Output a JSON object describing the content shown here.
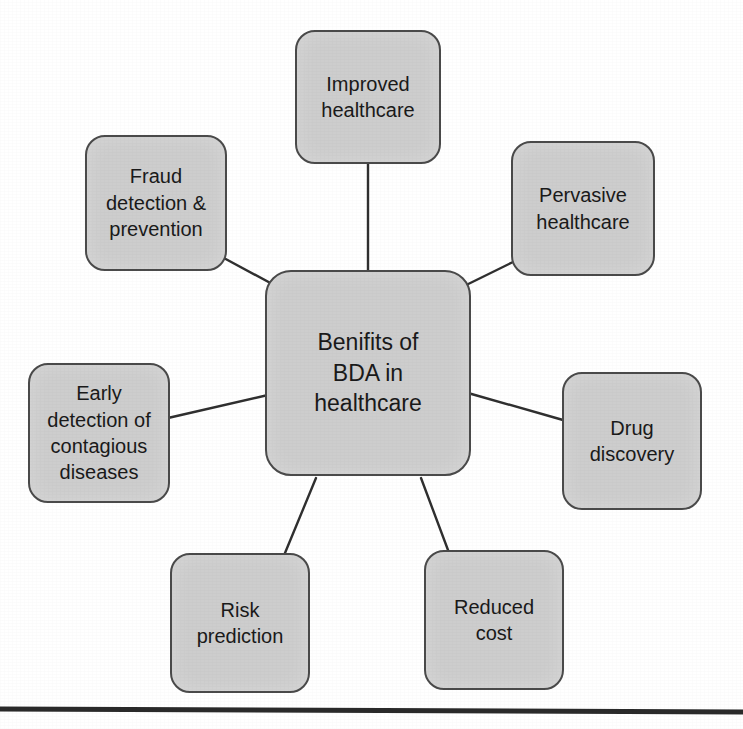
{
  "diagram": {
    "title": "Benifits of BDA in healthcare",
    "type": "hub-and-spoke mind map",
    "style": {
      "node_fill": "#cdcdcd",
      "node_border": "#4a4a4a",
      "connector_color": "#2f2f2f",
      "text_color": "#1a1a1a",
      "background": "#ffffff",
      "rule_color": "#2a2a2a"
    },
    "hub": {
      "label": "Benifits of\nBDA in\nhealthcare",
      "x": 265,
      "y": 270,
      "width": 206,
      "height": 206
    },
    "nodes": [
      {
        "id": "improved-healthcare",
        "label": "Improved\nhealthcare",
        "x": 295,
        "y": 30,
        "width": 146,
        "height": 134,
        "link": {
          "x1": 368,
          "y1": 164,
          "x2": 368,
          "y2": 270
        }
      },
      {
        "id": "fraud-detection-prevention",
        "label": "Fraud\ndetection &\nprevention",
        "x": 85,
        "y": 135,
        "width": 142,
        "height": 136,
        "link": {
          "x1": 222,
          "y1": 257,
          "x2": 287,
          "y2": 292
        }
      },
      {
        "id": "pervasive-healthcare",
        "label": "Pervasive\nhealthcare",
        "x": 511,
        "y": 141,
        "width": 144,
        "height": 135,
        "link": {
          "x1": 513,
          "y1": 262,
          "x2": 452,
          "y2": 292
        }
      },
      {
        "id": "early-detection-contagious-diseases",
        "label": "Early\ndetection of\ncontagious\ndiseases",
        "x": 28,
        "y": 363,
        "width": 142,
        "height": 140,
        "link": {
          "x1": 168,
          "y1": 418,
          "x2": 268,
          "y2": 395
        }
      },
      {
        "id": "drug-discovery",
        "label": "Drug\ndiscovery",
        "x": 562,
        "y": 372,
        "width": 140,
        "height": 138,
        "link": {
          "x1": 563,
          "y1": 420,
          "x2": 468,
          "y2": 393
        }
      },
      {
        "id": "risk-prediction",
        "label": "Risk\nprediction",
        "x": 170,
        "y": 553,
        "width": 140,
        "height": 140,
        "link": {
          "x1": 285,
          "y1": 553,
          "x2": 316,
          "y2": 478
        }
      },
      {
        "id": "reduced-cost",
        "label": "Reduced\ncost",
        "x": 424,
        "y": 550,
        "width": 140,
        "height": 140,
        "link": {
          "x1": 448,
          "y1": 550,
          "x2": 421,
          "y2": 478
        }
      }
    ],
    "bottom_rule": {
      "x1": 0,
      "y1": 709,
      "x2": 743,
      "y2": 712,
      "thickness": 5
    }
  }
}
